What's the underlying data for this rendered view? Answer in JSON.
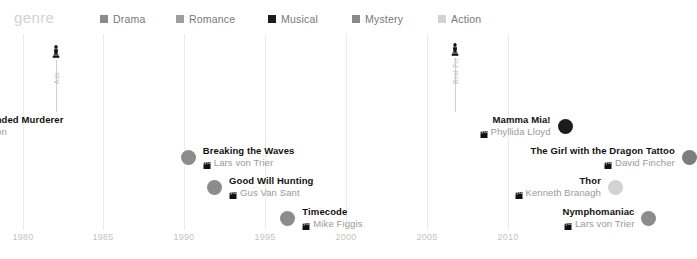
{
  "legend": {
    "title": "genre",
    "items": [
      {
        "label": "Drama",
        "color": "#8c8c8c",
        "x": 100
      },
      {
        "label": "Romance",
        "color": "#9e9e9e",
        "x": 176
      },
      {
        "label": "Musical",
        "color": "#1c1c1c",
        "x": 268
      },
      {
        "label": "Mystery",
        "color": "#8a8a8a",
        "x": 352
      },
      {
        "label": "Action",
        "color": "#d2d2d2",
        "x": 438
      }
    ]
  },
  "axis": {
    "ticks": [
      {
        "label": "1980",
        "x": 23
      },
      {
        "label": "1985",
        "x": 103
      },
      {
        "label": "1990",
        "x": 184
      },
      {
        "label": "1995",
        "x": 265
      },
      {
        "label": "2000",
        "x": 346
      },
      {
        "label": "2005",
        "x": 427
      },
      {
        "label": "2010",
        "x": 508
      }
    ],
    "xmin": 1978.6,
    "xmax": 2015
  },
  "annotations": [
    {
      "icon": "statue-award-icon",
      "label": "Aux",
      "x": 56,
      "icon_y": 10,
      "stem_top": 26,
      "stem_height": 52,
      "text_y": 50
    },
    {
      "icon": "statue-award-icon",
      "label": "Best Pic",
      "x": 455,
      "icon_y": 8,
      "stem_top": 24,
      "stem_height": 54,
      "text_y": 50
    }
  ],
  "films": [
    {
      "title": "The Simple-Minded Murderer",
      "director": "Hans Alfredson",
      "genre": "Drama",
      "color": "#8c8c8c",
      "side": "left",
      "dot_x": 56,
      "y": 80,
      "has_center_dot": true
    },
    {
      "title": "Breaking the Waves",
      "director": "Lars von Trier",
      "genre": "Drama",
      "color": "#8c8c8c",
      "side": "left",
      "dot_x": 287,
      "y": 111,
      "has_center_dot": false
    },
    {
      "title": "Good Will Hunting",
      "director": "Gus Van Sant",
      "genre": "Drama",
      "color": "#8c8c8c",
      "side": "left",
      "dot_x": 306,
      "y": 141,
      "has_center_dot": false
    },
    {
      "title": "Timecode",
      "director": "Mike Figgis",
      "genre": "Drama",
      "color": "#8c8c8c",
      "side": "left",
      "dot_x": 355,
      "y": 172,
      "has_center_dot": false
    },
    {
      "title": "Mamma Mia!",
      "director": "Phyllida Lloyd",
      "genre": "Musical",
      "color": "#1c1c1c",
      "side": "right",
      "dot_x": 487,
      "y": 80,
      "has_center_dot": false
    },
    {
      "title": "The Girl with the Dragon Tattoo",
      "director": "David Fincher",
      "genre": "Mystery",
      "color": "#7d7d7d",
      "side": "right",
      "dot_x": 538,
      "y": 111,
      "has_center_dot": false
    },
    {
      "title": "Thor",
      "director": "Kenneth Branagh",
      "genre": "Action",
      "color": "#d2d2d2",
      "side": "right",
      "dot_x": 522,
      "y": 141,
      "has_center_dot": false
    },
    {
      "title": "Nymphomaniac",
      "director": "Lars von Trier",
      "genre": "Drama",
      "color": "#8c8c8c",
      "side": "right",
      "dot_x": 570,
      "y": 172,
      "has_center_dot": false
    }
  ],
  "chart_data": {
    "type": "scatter",
    "title": "genre",
    "xlabel": "",
    "ylabel": "",
    "xlim": [
      1978.6,
      2015
    ],
    "xticks": [
      1980,
      1985,
      1990,
      1995,
      2000,
      2005,
      2010
    ],
    "grid": true,
    "legend_position": "top",
    "legend_entries": [
      "Drama",
      "Romance",
      "Musical",
      "Mystery",
      "Action"
    ],
    "points": [
      {
        "label": "The Simple-Minded Murderer",
        "director": "Hans Alfredson",
        "genre": "Drama",
        "year": 1982
      },
      {
        "title_note": "",
        "label": "Breaking the Waves",
        "director": "Lars von Trier",
        "genre": "Drama",
        "year": 1996
      },
      {
        "label": "Good Will Hunting",
        "director": "Gus Van Sant",
        "genre": "Drama",
        "year": 1997
      },
      {
        "label": "Timecode",
        "director": "Mike Figgis",
        "genre": "Drama",
        "year": 2000
      },
      {
        "label": "Mamma Mia!",
        "director": "Phyllida Lloyd",
        "genre": "Musical",
        "year": 2008
      },
      {
        "label": "The Girl with the Dragon Tattoo",
        "director": "David Fincher",
        "genre": "Mystery",
        "year": 2011
      },
      {
        "label": "Thor",
        "director": "Kenneth Branagh",
        "genre": "Action",
        "year": 2011
      },
      {
        "label": "Nymphomaniac",
        "director": "Lars von Trier",
        "genre": "Drama",
        "year": 2013
      }
    ],
    "annotations": [
      {
        "label": "Aux",
        "year": 1982
      },
      {
        "label": "Best Pic",
        "year": 2008
      }
    ]
  }
}
